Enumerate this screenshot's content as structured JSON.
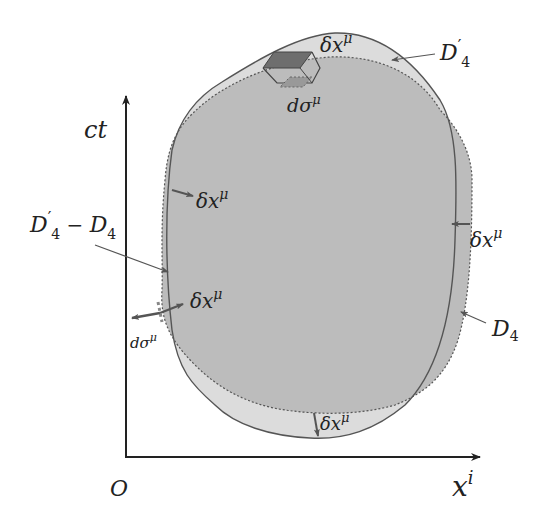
{
  "figure": {
    "type": "spacetime-volume-diagram",
    "colors": {
      "background": "#ffffff",
      "region_light": "#dcdcdc",
      "region_dark": "#bcbcbc",
      "outline": "#555555",
      "axis": "#222222",
      "element_dark": "#6e6e6e",
      "element_mid": "#999999",
      "text": "#222222"
    },
    "axes": {
      "vertical_label": "ct",
      "horizontal_label": "x",
      "horizontal_label_sup": "i",
      "origin_label": "O"
    },
    "regions": {
      "outer_label": "D",
      "outer_prime": "′",
      "outer_sub": "4",
      "inner_label": "D",
      "inner_sub": "4",
      "difference_label_prime": "D",
      "difference_prime": "′",
      "difference_sub1": "4",
      "difference_minus": " − ",
      "difference_label2": "D",
      "difference_sub2": "4"
    },
    "annotations": {
      "displacement": "δx",
      "displacement_sup": "μ",
      "surface_element": "dσ",
      "surface_element_sup": "μ"
    }
  }
}
